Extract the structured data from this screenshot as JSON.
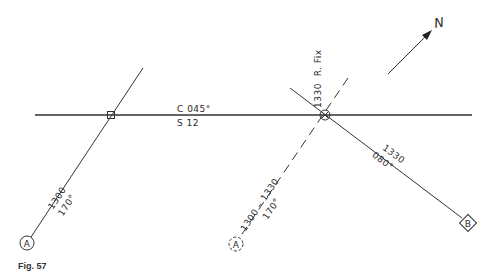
{
  "figure": {
    "caption": "Fig. 57",
    "north_label": "N"
  },
  "course_line": {
    "course_label": "C 045°",
    "speed_label": "S 12"
  },
  "lop_a": {
    "time_label": "1300",
    "bearing_label": "170°",
    "landmark_label": "A"
  },
  "lop_a_advanced": {
    "time_label": "1300 – 1330",
    "bearing_label": "170°",
    "landmark_label": "A"
  },
  "lop_b": {
    "time_label": "1330",
    "bearing_label": "080°",
    "landmark_label": "B"
  },
  "fix": {
    "label": "1330  R. Fix"
  },
  "colors": {
    "line": "#333333",
    "background": "#ffffff"
  }
}
